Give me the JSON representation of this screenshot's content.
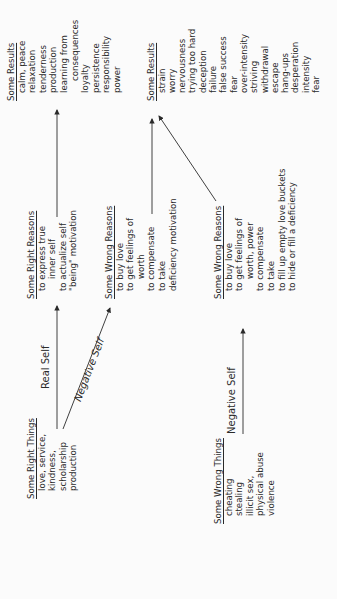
{
  "diagram": {
    "right_things": {
      "header": "Some Right Things",
      "items": [
        "love, service,",
        "kindness,",
        "scholarship",
        "production"
      ]
    },
    "wrong_things": {
      "header": "Some Wrong Things",
      "items": [
        "cheating",
        "stealing",
        "illicit sex,",
        "physical abuse",
        "violence"
      ]
    },
    "right_reasons": {
      "header": "Some Right Reasons",
      "items": [
        "to express true",
        "inner self",
        "to actualize self",
        "\"being\" motivation"
      ]
    },
    "wrong_reasons_1": {
      "header": "Some Wrong Reasons",
      "items": [
        "to buy love",
        "to get feelings of",
        "worth",
        "to compensate",
        "to take",
        "deficiency motivation"
      ]
    },
    "wrong_reasons_2": {
      "header": "Some Wrong Reasons",
      "items": [
        "to buy love",
        "to get feelings of",
        "worth, power",
        "to compensate",
        "to take",
        "to fill up empty love buckets",
        "to hide or fill a deficiency"
      ]
    },
    "good_results": {
      "header": "Some Results",
      "items": [
        "calm, peace",
        "relaxation",
        "tenderness",
        "production",
        "learning from",
        "consequences",
        "loyalty",
        "persistence",
        "responsibility",
        "power"
      ]
    },
    "bad_results": {
      "header": "Some Results",
      "items": [
        "strain",
        "worry",
        "nervousness",
        "trying too hard",
        "deception",
        "failure",
        "false success",
        "fear",
        "over-intensity",
        "striving",
        "withdrawal",
        "escape",
        "hang-ups",
        "desperation",
        "intensity",
        "fear"
      ]
    },
    "labels": {
      "real_self": "Real Self",
      "negative_self_diag": "Negative Self",
      "negative_self_bottom": "Negative Self"
    }
  }
}
